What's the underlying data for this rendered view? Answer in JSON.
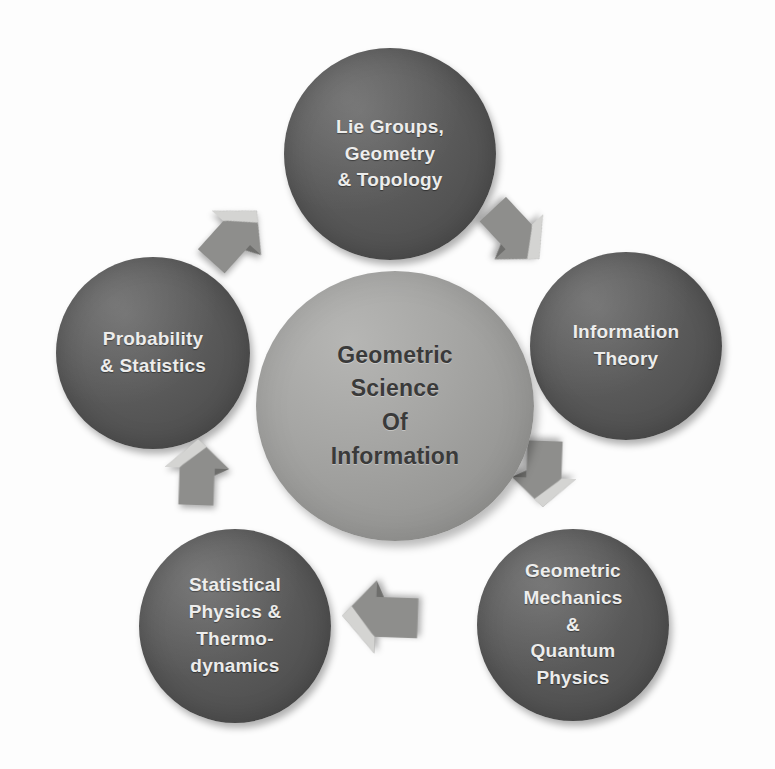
{
  "diagram": {
    "type": "cycle-diagram",
    "title": "Geometric Science Of Information",
    "background_color": "#fdfdfd",
    "center": {
      "id": "center",
      "name": "geometric-science-of-information",
      "label": "Geometric\nScience\nOf\nInformation",
      "lines": [
        "Geometric",
        "Science",
        "Of",
        "Information"
      ],
      "fill_color": "#9a9a98",
      "text_color": "#3a3a3a",
      "shape": "circle"
    },
    "nodes": [
      {
        "id": "lie",
        "name": "lie-groups-geometry-topology",
        "label": "Lie Groups,\nGeometry\n& Topology",
        "lines": [
          "Lie Groups,",
          "Geometry",
          "& Topology"
        ],
        "position": "top",
        "fill_color": "#585858",
        "text_color": "#ececeb",
        "shape": "circle"
      },
      {
        "id": "info",
        "name": "information-theory",
        "label": "Information\nTheory",
        "lines": [
          "Information",
          "Theory"
        ],
        "position": "right",
        "fill_color": "#585858",
        "text_color": "#ececeb",
        "shape": "circle"
      },
      {
        "id": "geomech",
        "name": "geometric-mechanics-quantum-physics",
        "label": "Geometric\nMechanics\n&\nQuantum\nPhysics",
        "lines": [
          "Geometric",
          "Mechanics",
          "&",
          "Quantum",
          "Physics"
        ],
        "position": "bottom-right",
        "fill_color": "#585858",
        "text_color": "#ececeb",
        "shape": "circle"
      },
      {
        "id": "statphys",
        "name": "statistical-physics-thermodynamics",
        "label": "Statistical\nPhysics &\nThermo-\ndynamics",
        "lines": [
          "Statistical",
          "Physics &",
          "Thermo-",
          "dynamics"
        ],
        "position": "bottom-left",
        "fill_color": "#585858",
        "text_color": "#ececeb",
        "shape": "circle"
      },
      {
        "id": "prob",
        "name": "probability-statistics",
        "label": "Probability\n& Statistics",
        "lines": [
          "Probability",
          "& Statistics"
        ],
        "position": "left",
        "fill_color": "#585858",
        "text_color": "#ececeb",
        "shape": "circle"
      }
    ],
    "arrows": [
      {
        "id": "prob-to-lie",
        "name": "arrow-probability-to-lie-groups",
        "from": "prob",
        "to": "lie",
        "direction": "up-right",
        "color": "#8e8e8c"
      },
      {
        "id": "lie-to-info",
        "name": "arrow-lie-groups-to-information-theory",
        "from": "lie",
        "to": "info",
        "direction": "down-right",
        "color": "#8e8e8c"
      },
      {
        "id": "info-to-gm",
        "name": "arrow-information-theory-to-geometric-mechanics",
        "from": "info",
        "to": "geomech",
        "direction": "down",
        "color": "#8e8e8c"
      },
      {
        "id": "gm-to-sp",
        "name": "arrow-geometric-mechanics-to-statistical-physics",
        "from": "geomech",
        "to": "statphys",
        "direction": "left",
        "color": "#8e8e8c"
      },
      {
        "id": "sp-to-prob",
        "name": "arrow-statistical-physics-to-probability",
        "from": "statphys",
        "to": "prob",
        "direction": "up",
        "color": "#8e8e8c"
      }
    ],
    "flow": "clockwise"
  }
}
